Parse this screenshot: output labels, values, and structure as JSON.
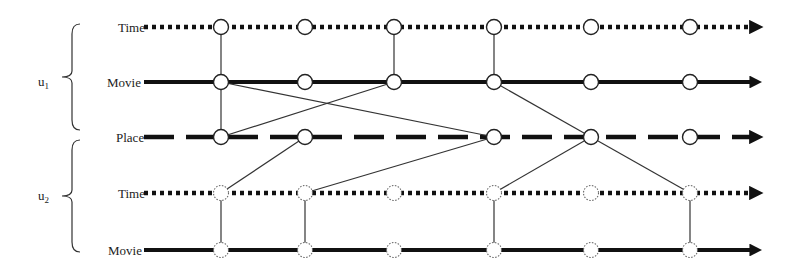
{
  "users": [
    {
      "id": "u1",
      "label": "u",
      "sub": "1",
      "rows": [
        0,
        1,
        2
      ]
    },
    {
      "id": "u2",
      "label": "u",
      "sub": "2",
      "rows": [
        2,
        3,
        4
      ]
    }
  ],
  "rows": [
    {
      "label": "Time",
      "style": "dotted",
      "owner": "u1",
      "nodes": [
        0,
        1,
        2,
        3,
        4,
        5
      ],
      "node_style": "solid"
    },
    {
      "label": "Movie",
      "style": "solid",
      "owner": "u1",
      "nodes": [
        0,
        1,
        2,
        3,
        4,
        5
      ],
      "node_style": "solid"
    },
    {
      "label": "Place",
      "style": "dashed",
      "owner": "shared",
      "nodes": [
        0,
        1,
        3,
        4,
        5
      ],
      "node_style": "solid"
    },
    {
      "label": "Time",
      "style": "dotted",
      "owner": "u2",
      "nodes": [
        0,
        1,
        2,
        3,
        4,
        5
      ],
      "node_style": "dotted"
    },
    {
      "label": "Movie",
      "style": "solid",
      "owner": "u2",
      "nodes": [
        0,
        1,
        2,
        3,
        4,
        5
      ],
      "node_style": "dotted"
    }
  ],
  "edges": [
    [
      [
        0,
        0
      ],
      [
        1,
        0
      ]
    ],
    [
      [
        1,
        0
      ],
      [
        2,
        0
      ]
    ],
    [
      [
        1,
        0
      ],
      [
        2,
        3
      ]
    ],
    [
      [
        2,
        0
      ],
      [
        1,
        2
      ]
    ],
    [
      [
        0,
        2
      ],
      [
        1,
        2
      ]
    ],
    [
      [
        0,
        3
      ],
      [
        1,
        3
      ]
    ],
    [
      [
        1,
        3
      ],
      [
        2,
        4
      ]
    ],
    [
      [
        2,
        1
      ],
      [
        3,
        0
      ]
    ],
    [
      [
        2,
        3
      ],
      [
        3,
        1
      ]
    ],
    [
      [
        2,
        4
      ],
      [
        3,
        3
      ]
    ],
    [
      [
        2,
        4
      ],
      [
        3,
        5
      ]
    ],
    [
      [
        3,
        0
      ],
      [
        4,
        0
      ]
    ],
    [
      [
        3,
        1
      ],
      [
        4,
        1
      ]
    ],
    [
      [
        3,
        3
      ],
      [
        4,
        3
      ]
    ],
    [
      [
        3,
        5
      ],
      [
        4,
        5
      ]
    ]
  ]
}
